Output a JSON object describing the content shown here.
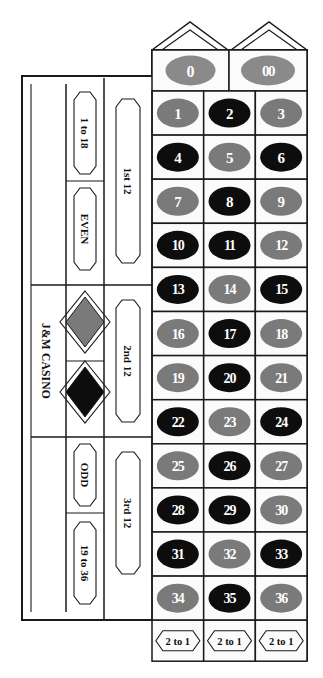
{
  "board": {
    "title": "J&M CASINO",
    "casino_label": "J&M CASINO",
    "colors": {
      "red": "#7a7a7a",
      "black": "#0d0d0d",
      "green": "#8a8a8a",
      "line": "#1a1a1a",
      "felt": "#fbfbfb",
      "number_text": "#ffffff",
      "bet_text": "#111111"
    },
    "zeros": [
      {
        "label": "0",
        "color": "green"
      },
      {
        "label": "00",
        "color": "green"
      }
    ],
    "numbers": [
      {
        "label": "1",
        "color": "red"
      },
      {
        "label": "2",
        "color": "black"
      },
      {
        "label": "3",
        "color": "red"
      },
      {
        "label": "4",
        "color": "black"
      },
      {
        "label": "5",
        "color": "red"
      },
      {
        "label": "6",
        "color": "black"
      },
      {
        "label": "7",
        "color": "red"
      },
      {
        "label": "8",
        "color": "black"
      },
      {
        "label": "9",
        "color": "red"
      },
      {
        "label": "10",
        "color": "black"
      },
      {
        "label": "11",
        "color": "black"
      },
      {
        "label": "12",
        "color": "red"
      },
      {
        "label": "13",
        "color": "black"
      },
      {
        "label": "14",
        "color": "red"
      },
      {
        "label": "15",
        "color": "black"
      },
      {
        "label": "16",
        "color": "red"
      },
      {
        "label": "17",
        "color": "black"
      },
      {
        "label": "18",
        "color": "red"
      },
      {
        "label": "19",
        "color": "red"
      },
      {
        "label": "20",
        "color": "black"
      },
      {
        "label": "21",
        "color": "red"
      },
      {
        "label": "22",
        "color": "black"
      },
      {
        "label": "23",
        "color": "red"
      },
      {
        "label": "24",
        "color": "black"
      },
      {
        "label": "25",
        "color": "red"
      },
      {
        "label": "26",
        "color": "black"
      },
      {
        "label": "27",
        "color": "red"
      },
      {
        "label": "28",
        "color": "black"
      },
      {
        "label": "29",
        "color": "black"
      },
      {
        "label": "30",
        "color": "red"
      },
      {
        "label": "31",
        "color": "black"
      },
      {
        "label": "32",
        "color": "red"
      },
      {
        "label": "33",
        "color": "black"
      },
      {
        "label": "34",
        "color": "red"
      },
      {
        "label": "35",
        "color": "black"
      },
      {
        "label": "36",
        "color": "red"
      }
    ],
    "dozens": [
      {
        "label": "1st 12"
      },
      {
        "label": "2nd 12"
      },
      {
        "label": "3rd 12"
      }
    ],
    "outside_bets": [
      {
        "label": "1 to 18",
        "kind": "range"
      },
      {
        "label": "EVEN",
        "kind": "parity"
      },
      {
        "label": "RED",
        "kind": "diamond-red",
        "shape": "diamond",
        "color": "red"
      },
      {
        "label": "BLACK",
        "kind": "diamond-black",
        "shape": "diamond",
        "color": "black"
      },
      {
        "label": "ODD",
        "kind": "parity"
      },
      {
        "label": "19 to 36",
        "kind": "range"
      }
    ],
    "column_bets": [
      {
        "label": "2 to 1"
      },
      {
        "label": "2 to 1"
      },
      {
        "label": "2 to 1"
      }
    ]
  }
}
